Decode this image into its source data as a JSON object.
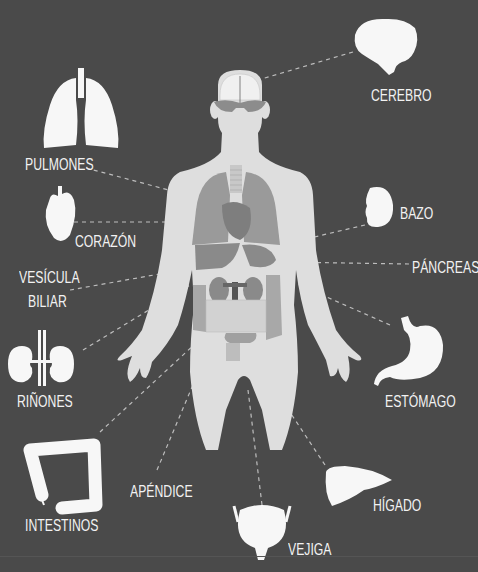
{
  "diagram": {
    "type": "anatomy-infographic",
    "background": "#4a4a4a",
    "figure_color": "#dcdcdc",
    "organ_color": "#9a9a9a",
    "icon_color": "#f5f5f5",
    "connector_style": "dashed",
    "labels": {
      "brain": "CEREBRO",
      "lungs": "PULMONES",
      "heart": "CORAZÓN",
      "gallbladder_line1": "VESÍCULA",
      "gallbladder_line2": "BILIAR",
      "kidneys": "RIÑONES",
      "intestines": "INTESTINOS",
      "appendix": "APÉNDICE",
      "bladder": "VEJIGA",
      "liver": "HÍGADO",
      "stomach": "ESTÓMAGO",
      "pancreas": "PÁNCREAS",
      "spleen": "BAZO"
    }
  }
}
